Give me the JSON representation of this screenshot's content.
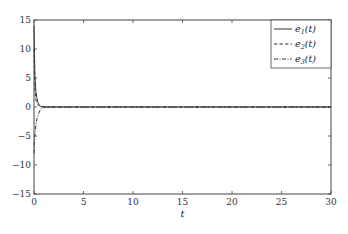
{
  "chart_data": {
    "type": "line",
    "title": "",
    "xlabel": "t",
    "ylabel": "",
    "xlim": [
      0,
      30
    ],
    "ylim": [
      -15,
      15
    ],
    "xticks": [
      0,
      5,
      10,
      15,
      20,
      25,
      30
    ],
    "yticks": [
      -15,
      -10,
      -5,
      0,
      5,
      10,
      15
    ],
    "xtick_labels": [
      "0",
      "5",
      "10",
      "15",
      "20",
      "25",
      "30"
    ],
    "ytick_labels": [
      "−15",
      "−10",
      "−5",
      "0",
      "5",
      "10",
      "15"
    ],
    "grid": false,
    "legend_position": "upper right",
    "series": [
      {
        "name": "e1(t)",
        "style": "solid",
        "x": [
          0,
          0.05,
          0.1,
          0.2,
          0.3,
          0.4,
          0.5,
          0.7,
          1.0,
          30
        ],
        "y": [
          14,
          9,
          5,
          2.5,
          1.5,
          0.8,
          0.4,
          0.1,
          0,
          0
        ]
      },
      {
        "name": "e2(t)",
        "style": "dashed",
        "x": [
          0,
          0.05,
          0.1,
          0.2,
          0.3,
          0.5,
          0.8,
          1.0,
          30
        ],
        "y": [
          10,
          6,
          3,
          1.2,
          0.6,
          0.2,
          0.05,
          0,
          0
        ]
      },
      {
        "name": "e3(t)",
        "style": "dashdot",
        "x": [
          0,
          0.05,
          0.1,
          0.2,
          0.3,
          0.5,
          0.7,
          1.0,
          30
        ],
        "y": [
          -8,
          -6,
          -4.5,
          -3,
          -2,
          -1,
          -0.3,
          0,
          0
        ]
      }
    ]
  },
  "legend": {
    "items": [
      {
        "base": "e",
        "sub": "1",
        "suffix": "(t)"
      },
      {
        "base": "e",
        "sub": "2",
        "suffix": "(t)"
      },
      {
        "base": "e",
        "sub": "3",
        "suffix": "(t)"
      }
    ]
  },
  "axes": {
    "xlabel": "t"
  },
  "colors": {
    "line": "#333333",
    "axis": "#444444"
  }
}
